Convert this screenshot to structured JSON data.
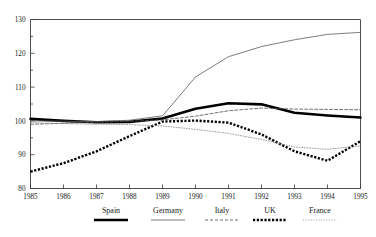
{
  "chart_data": {
    "type": "line",
    "title": "",
    "subtitle": "",
    "xlabel": "",
    "ylabel": "",
    "x": [
      1985,
      1986,
      1987,
      1988,
      1989,
      1990,
      1991,
      1992,
      1993,
      1994,
      1995
    ],
    "xtick_labels": [
      "1985",
      "1986",
      "1987",
      "1988",
      "1989",
      "1990",
      "1991",
      "1992",
      "1993",
      "1994",
      "1995"
    ],
    "ytick_labels": [
      "80",
      "90",
      "100",
      "110",
      "120",
      "130"
    ],
    "yticks": [
      80,
      90,
      100,
      110,
      120,
      130
    ],
    "xlim": [
      1985,
      1995
    ],
    "ylim": [
      80,
      130
    ],
    "grid": false,
    "legend_position": "bottom",
    "series": [
      {
        "name": "Spain",
        "style": "thick-solid",
        "color": "#000000",
        "values": [
          100.6,
          100.0,
          99.6,
          99.7,
          100.7,
          103.6,
          105.2,
          104.9,
          102.4,
          101.6,
          101.0
        ]
      },
      {
        "name": "Germany",
        "style": "thin-solid",
        "color": "#5a5a5a",
        "values": [
          100.0,
          99.9,
          99.8,
          100.2,
          101.5,
          113.0,
          119.0,
          122.0,
          124.0,
          125.6,
          126.2
        ]
      },
      {
        "name": "Italy",
        "style": "dashed",
        "color": "#4a4a4a",
        "values": [
          99.0,
          99.3,
          99.6,
          99.9,
          100.3,
          101.4,
          103.0,
          103.8,
          103.5,
          103.4,
          103.3
        ]
      },
      {
        "name": "UK",
        "style": "thick-dotted",
        "color": "#000000",
        "values": [
          85.0,
          87.5,
          91.0,
          95.5,
          99.8,
          100.1,
          99.5,
          96.0,
          91.0,
          88.2,
          94.0
        ]
      },
      {
        "name": "France",
        "style": "fine-dotted",
        "color": "#8a8a8a",
        "values": [
          99.5,
          99.2,
          99.0,
          98.9,
          98.5,
          97.5,
          96.3,
          94.5,
          92.3,
          91.6,
          92.6
        ]
      }
    ]
  },
  "legend": {
    "items": [
      {
        "label": "Spain"
      },
      {
        "label": "Germany"
      },
      {
        "label": "Italy"
      },
      {
        "label": "UK"
      },
      {
        "label": "France"
      }
    ]
  },
  "artifact": {
    "top_ghost_text": ""
  }
}
